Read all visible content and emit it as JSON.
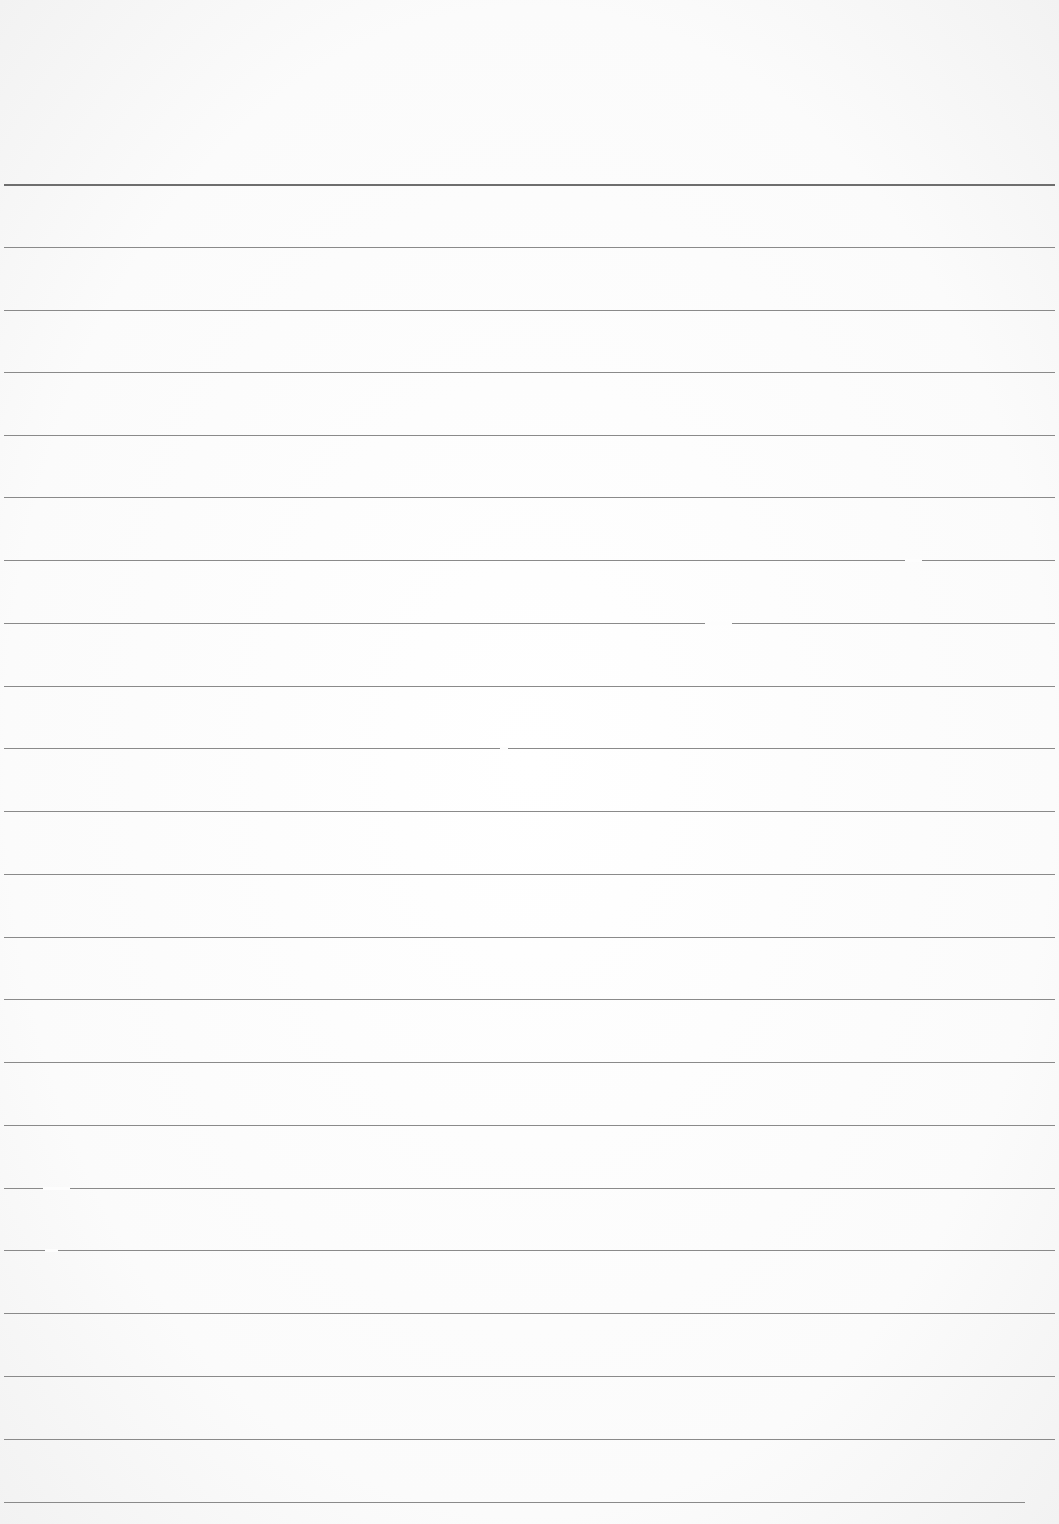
{
  "document": {
    "type": "lined-paper",
    "text": "",
    "line_color": "#8a8a8a",
    "header_line_color": "#6e6e6e",
    "paper_color": "#fdfdfd",
    "header_line_y": 184,
    "line_spacing": 62.9,
    "lines": [
      {
        "y": 184,
        "x1": 4,
        "x2": 1055
      },
      {
        "y": 247,
        "x1": 4,
        "x2": 1055
      },
      {
        "y": 310,
        "x1": 4,
        "x2": 1055
      },
      {
        "y": 372,
        "x1": 4,
        "x2": 1055
      },
      {
        "y": 435,
        "x1": 4,
        "x2": 1055
      },
      {
        "y": 497,
        "x1": 4,
        "x2": 1055
      },
      {
        "y": 560,
        "x1": 4,
        "x2": 1055,
        "gap": [
          905,
          922
        ]
      },
      {
        "y": 623,
        "x1": 4,
        "x2": 1055,
        "gap": [
          705,
          732
        ]
      },
      {
        "y": 686,
        "x1": 4,
        "x2": 1055
      },
      {
        "y": 748,
        "x1": 4,
        "x2": 1055,
        "gap": [
          500,
          508
        ]
      },
      {
        "y": 811,
        "x1": 4,
        "x2": 1055
      },
      {
        "y": 874,
        "x1": 4,
        "x2": 1055
      },
      {
        "y": 937,
        "x1": 4,
        "x2": 1055
      },
      {
        "y": 999,
        "x1": 4,
        "x2": 1055
      },
      {
        "y": 1062,
        "x1": 4,
        "x2": 1055
      },
      {
        "y": 1125,
        "x1": 4,
        "x2": 1055
      },
      {
        "y": 1188,
        "x1": 4,
        "x2": 1055,
        "gap": [
          43,
          70
        ]
      },
      {
        "y": 1250,
        "x1": 4,
        "x2": 1055,
        "gap": [
          45,
          58
        ]
      },
      {
        "y": 1313,
        "x1": 4,
        "x2": 1055
      },
      {
        "y": 1376,
        "x1": 4,
        "x2": 1055
      },
      {
        "y": 1439,
        "x1": 4,
        "x2": 1055
      },
      {
        "y": 1502,
        "x1": 4,
        "x2": 1025
      }
    ]
  }
}
